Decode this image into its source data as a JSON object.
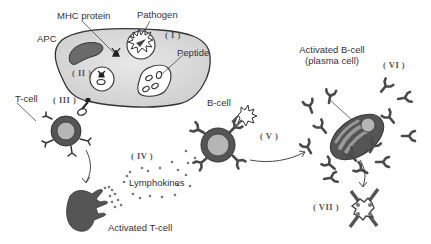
{
  "diagram": {
    "labels": {
      "apc": "APC",
      "mhc_protein": "MHC protein",
      "pathogen": "Pathogen",
      "peptide": "Peptide",
      "t_cell": "T-cell",
      "b_cell": "B-cell",
      "lymphokines": "Lymphokines",
      "activated_t_cell": "Activated T-cell",
      "activated_b_cell_line1": "Activated B-cell",
      "activated_b_cell_line2": "(plasma cell)"
    },
    "steps": [
      {
        "id": "I",
        "label": "( I )"
      },
      {
        "id": "II",
        "label": "( II )"
      },
      {
        "id": "III",
        "label": "( III )"
      },
      {
        "id": "IV",
        "label": "( IV )"
      },
      {
        "id": "V",
        "label": "( V )"
      },
      {
        "id": "VI",
        "label": "( VI )"
      },
      {
        "id": "VII",
        "label": "( VII )"
      }
    ],
    "colors": {
      "cell_fill": "#d9d9d9",
      "dark_fill": "#555555",
      "outline": "#333333",
      "nucleus": "#b5b5b5"
    }
  }
}
